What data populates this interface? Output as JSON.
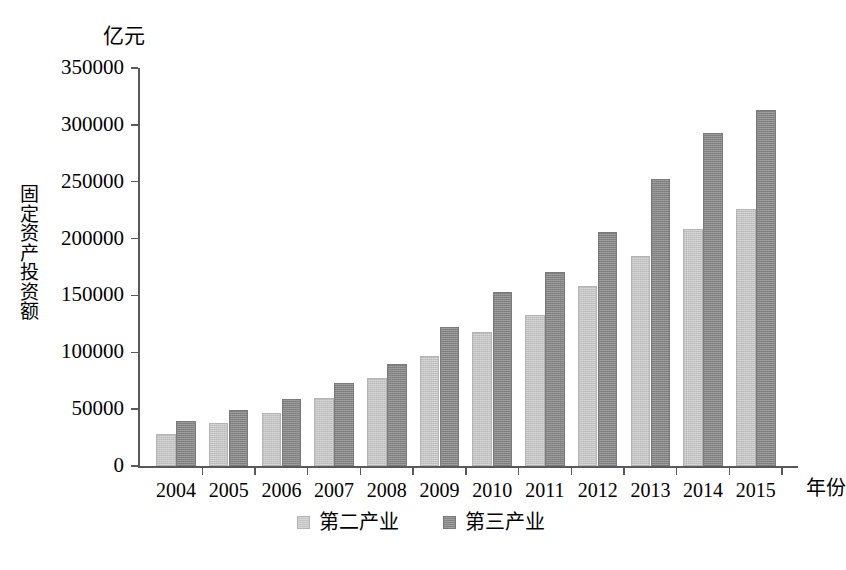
{
  "chart_data": {
    "type": "bar",
    "title": "",
    "subtitle": "",
    "xlabel": "年份",
    "ylabel": "固定资产投资额",
    "unit_label": "亿元",
    "categories": [
      "2004",
      "2005",
      "2006",
      "2007",
      "2008",
      "2009",
      "2010",
      "2011",
      "2012",
      "2013",
      "2014",
      "2015"
    ],
    "series": [
      {
        "name": "第二产业",
        "color": "#c3c3c3",
        "values": [
          28000,
          38000,
          47000,
          60000,
          77000,
          97000,
          118000,
          133000,
          158000,
          185000,
          208000,
          226000
        ]
      },
      {
        "name": "第三产业",
        "color": "#848484",
        "values": [
          40000,
          49000,
          59000,
          73000,
          90000,
          122000,
          153000,
          171000,
          206000,
          252000,
          293000,
          313000
        ]
      }
    ],
    "ylim": [
      0,
      350000
    ],
    "ytick_values": [
      0,
      50000,
      100000,
      150000,
      200000,
      250000,
      300000,
      350000
    ],
    "ytick_labels": [
      "0",
      "50000",
      "100000",
      "150000",
      "200000",
      "250000",
      "300000",
      "350000"
    ],
    "grid": false,
    "legend_position": "bottom-center"
  },
  "legend": {
    "entries": [
      {
        "label": "第二产业",
        "swatch": "series-1-swatch"
      },
      {
        "label": "第三产业",
        "swatch": "series-2-swatch"
      }
    ]
  },
  "caption": {
    "remnant": ""
  }
}
